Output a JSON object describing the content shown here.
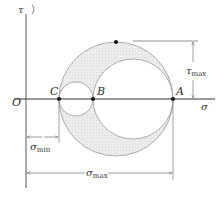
{
  "diagram": {
    "axes": {
      "vertical_label": "τ",
      "horizontal_label": "σ",
      "origin_label": "O"
    },
    "points": {
      "C": "C",
      "B": "B",
      "A": "A"
    },
    "dimensions": {
      "tau_max": "τ",
      "tau_max_sub": "max",
      "sigma_min": "σ",
      "sigma_min_sub": "min",
      "sigma_max": "σ",
      "sigma_max_sub": "max"
    },
    "colors": {
      "shade": "#e6e6e6",
      "line": "#888888",
      "axis": "#333333",
      "dot": "#111111"
    }
  }
}
